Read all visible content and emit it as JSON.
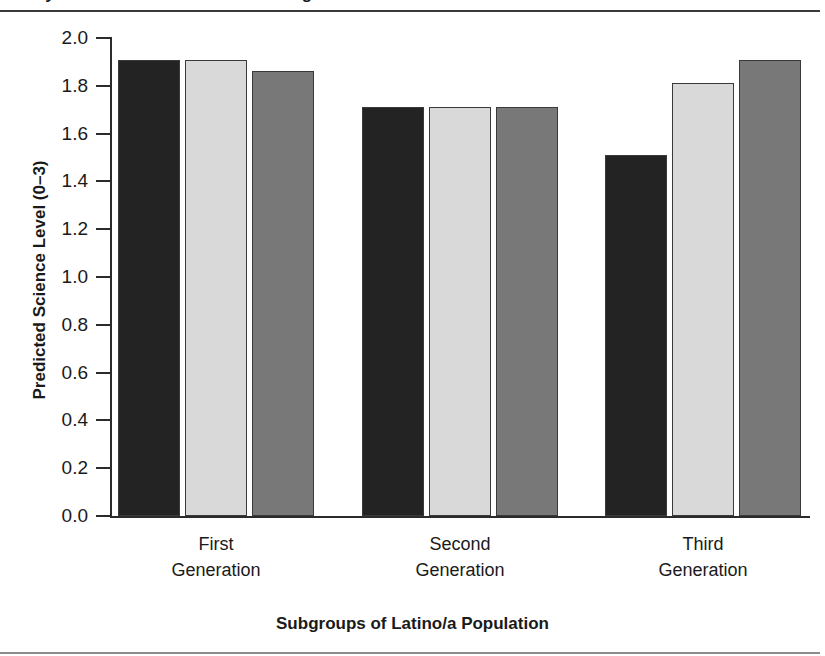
{
  "figure": {
    "title_cropped": "Study of Science Achievement among Latino/a Students",
    "x_axis_title": "Subgroups of Latino/a Population",
    "y_axis_title": "Predicted Science Level (0–3)"
  },
  "axis": {
    "y_ticks": [
      "2.0",
      "1.8",
      "1.6",
      "1.4",
      "1.2",
      "1.0",
      "0.8",
      "0.6",
      "0.4",
      "0.2",
      "0.0"
    ]
  },
  "groups": [
    {
      "label": "First\nGeneration"
    },
    {
      "label": "Second\nGeneration"
    },
    {
      "label": "Third\nGeneration"
    }
  ],
  "colors": {
    "series_1": "#232323",
    "series_2": "#d9d9d9",
    "series_3": "#787878",
    "axis": "#2b2b2b",
    "bar_outline": "#3a3a3a",
    "text": "#1a1a1a"
  },
  "chart_data": {
    "type": "bar",
    "xlabel": "Subgroups of Latino/a Population",
    "ylabel": "Predicted Science Level (0–3)",
    "categories": [
      "First Generation",
      "Second Generation",
      "Third Generation"
    ],
    "ylim": [
      0.0,
      2.0
    ],
    "ytick_step": 0.2,
    "grid": false,
    "legend": "none",
    "series": [
      {
        "name": "Series 1 (dark)",
        "color": "#232323",
        "values": [
          1.91,
          1.71,
          1.51
        ]
      },
      {
        "name": "Series 2 (light gray)",
        "color": "#d9d9d9",
        "values": [
          1.91,
          1.71,
          1.81
        ]
      },
      {
        "name": "Series 3 (medium gray)",
        "color": "#787878",
        "values": [
          1.86,
          1.71,
          1.91
        ]
      }
    ]
  }
}
